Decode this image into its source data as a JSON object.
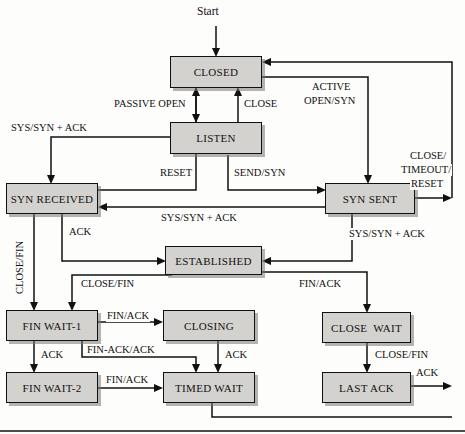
{
  "diagram": {
    "type": "state-machine",
    "start_label": "Start",
    "colors": {
      "state_fill": "#d4d2cf",
      "stroke": "#111111",
      "background": "#fdfdfb",
      "shadow": "#787673"
    },
    "states": [
      {
        "id": "closed",
        "label": "CLOSED",
        "x": 170,
        "y": 56,
        "w": 92,
        "h": 32
      },
      {
        "id": "listen",
        "label": "LISTEN",
        "x": 170,
        "y": 122,
        "w": 92,
        "h": 32
      },
      {
        "id": "syn_received",
        "label": "SYN RECEIVED",
        "x": 6,
        "y": 183,
        "w": 92,
        "h": 31
      },
      {
        "id": "syn_sent",
        "label": "SYN SENT",
        "x": 325,
        "y": 183,
        "w": 90,
        "h": 31
      },
      {
        "id": "established",
        "label": "ESTABLISHED",
        "x": 165,
        "y": 246,
        "w": 97,
        "h": 29
      },
      {
        "id": "fin_wait_1",
        "label": "FIN WAIT-1",
        "x": 6,
        "y": 310,
        "w": 92,
        "h": 31
      },
      {
        "id": "closing",
        "label": "CLOSING",
        "x": 163,
        "y": 310,
        "w": 92,
        "h": 31
      },
      {
        "id": "close_wait",
        "label": "CLOSE  WAIT",
        "x": 322,
        "y": 312,
        "w": 89,
        "h": 31
      },
      {
        "id": "fin_wait_2",
        "label": "FIN WAIT-2",
        "x": 6,
        "y": 372,
        "w": 92,
        "h": 31
      },
      {
        "id": "timed_wait",
        "label": "TIMED WAIT",
        "x": 163,
        "y": 372,
        "w": 92,
        "h": 31
      },
      {
        "id": "last_ack",
        "label": "LAST ACK",
        "x": 322,
        "y": 372,
        "w": 89,
        "h": 31
      }
    ],
    "transitions": [
      {
        "id": "t_start",
        "from": "start",
        "to": "closed",
        "label": "Start"
      },
      {
        "id": "t_passive_open",
        "from": "closed",
        "to": "listen",
        "label": "PASSIVE OPEN"
      },
      {
        "id": "t_close",
        "from": "listen",
        "to": "closed",
        "label": "CLOSE"
      },
      {
        "id": "t_active_open",
        "from": "closed",
        "to": "syn_sent",
        "label": "ACTIVE\nOPEN/SYN"
      },
      {
        "id": "t_syn_synack_listen",
        "from": "listen",
        "to": "syn_received",
        "label": "SYS/SYN + ACK"
      },
      {
        "id": "t_reset",
        "from": "syn_received",
        "to": "closed",
        "label": "RESET"
      },
      {
        "id": "t_send_syn",
        "from": "listen",
        "to": "syn_sent",
        "label": "SEND/SYN"
      },
      {
        "id": "t_synsent_synrecv",
        "from": "syn_sent",
        "to": "syn_received",
        "label": "SYS/SYN + ACK"
      },
      {
        "id": "t_close_timeout",
        "from": "syn_sent",
        "to": "closed",
        "label": "CLOSE/\nTIMEOUT/\nRESET"
      },
      {
        "id": "t_ack_est",
        "from": "syn_received",
        "to": "established",
        "label": "ACK"
      },
      {
        "id": "t_synsent_est",
        "from": "syn_sent",
        "to": "established",
        "label": "SYS/SYN + ACK"
      },
      {
        "id": "t_closefin_left",
        "from": "syn_received",
        "to": "fin_wait_1",
        "label": "CLOSE/FIN"
      },
      {
        "id": "t_est_finwait1",
        "from": "established",
        "to": "fin_wait_1",
        "label": "CLOSE/FIN"
      },
      {
        "id": "t_est_closewait",
        "from": "established",
        "to": "close_wait",
        "label": "FIN/ACK"
      },
      {
        "id": "t_fw1_closing",
        "from": "fin_wait_1",
        "to": "closing",
        "label": "FIN/ACK"
      },
      {
        "id": "t_fw1_fw2",
        "from": "fin_wait_1",
        "to": "fin_wait_2",
        "label": "ACK"
      },
      {
        "id": "t_fw1_timed",
        "from": "fin_wait_1",
        "to": "timed_wait",
        "label": "FIN-ACK/ACK"
      },
      {
        "id": "t_closing_timed",
        "from": "closing",
        "to": "timed_wait",
        "label": "ACK"
      },
      {
        "id": "t_fw2_timed",
        "from": "fin_wait_2",
        "to": "timed_wait",
        "label": "FIN/ACK"
      },
      {
        "id": "t_cw_lastack",
        "from": "close_wait",
        "to": "last_ack",
        "label": "CLOSE/FIN"
      },
      {
        "id": "t_lastack_closed",
        "from": "last_ack",
        "to": "closed",
        "label": "ACK"
      },
      {
        "id": "t_timed_closed",
        "from": "timed_wait",
        "to": "closed",
        "label": ""
      }
    ],
    "labels": {
      "start": "Start",
      "passive_open": "PASSIVE OPEN",
      "close": "CLOSE",
      "active_open_1": "ACTIVE",
      "active_open_2": "OPEN/SYN",
      "sys_syn_ack_left": "SYS/SYN + ACK",
      "reset": "RESET",
      "send_syn": "SEND/SYN",
      "close_timeout_1": "CLOSE/",
      "close_timeout_2": "TIMEOUT/",
      "close_timeout_3": "RESET",
      "sys_syn_ack_mid": "SYS/SYN + ACK",
      "sys_syn_ack_right": "SYS/SYN + ACK",
      "ack_est": "ACK",
      "close_fin_vert": "CLOSE/FIN",
      "close_fin_est": "CLOSE/FIN",
      "fin_ack_est": "FIN/ACK",
      "fin_ack_closing": "FIN/ACK",
      "ack_fw2": "ACK",
      "fin_ack_ack": "FIN-ACK/ACK",
      "ack_closing": "ACK",
      "fin_ack_fw2": "FIN/ACK",
      "close_fin_cw": "CLOSE/FIN",
      "ack_lastack": "ACK"
    }
  }
}
